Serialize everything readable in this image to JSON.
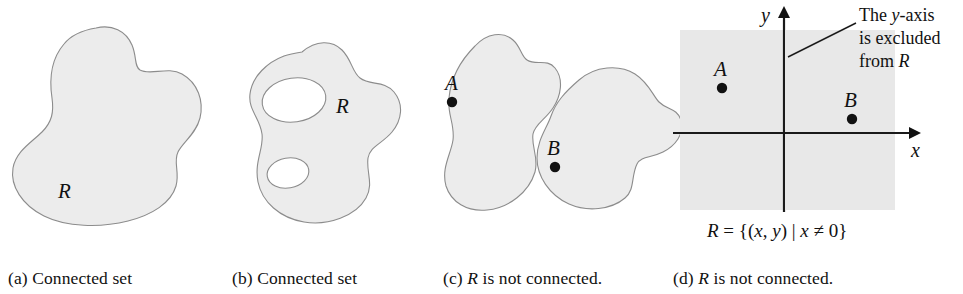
{
  "figure": {
    "panels": [
      {
        "id": "a",
        "caption_tag": "(a)",
        "caption_text": "Connected set",
        "region_label": "R",
        "points": []
      },
      {
        "id": "b",
        "caption_tag": "(b)",
        "caption_text": "Connected set",
        "region_label": "R",
        "points": []
      },
      {
        "id": "c",
        "caption_tag": "(c)",
        "caption_prefix_italic": "R",
        "caption_text": "is not connected.",
        "points": [
          {
            "label": "A"
          },
          {
            "label": "B"
          }
        ]
      },
      {
        "id": "d",
        "caption_tag": "(d)",
        "caption_prefix_italic": "R",
        "caption_text": "is not connected.",
        "axis_x_label": "x",
        "axis_y_label": "y",
        "points": [
          {
            "label": "A"
          },
          {
            "label": "B"
          }
        ],
        "annotation_lines": [
          {
            "pre": "The ",
            "italic": "y",
            "post": "-axis"
          },
          {
            "pre": "is excluded",
            "italic": "",
            "post": ""
          },
          {
            "pre": "from ",
            "italic": "R",
            "post": ""
          }
        ],
        "set_builder": {
          "lhs": "R",
          "equals": " = ",
          "open": "{(",
          "var_x": "x",
          "comma": ", ",
          "var_y": "y",
          "bar": ") | ",
          "cond_var": "x",
          "cond_rel": " ≠ 0",
          "close": "}"
        }
      }
    ]
  },
  "colors": {
    "region_fill": "#ececec",
    "region_stroke": "#8c8c8c",
    "plane_fill": "#e8e8e8",
    "axis": "#1a1a1a",
    "text": "#111111",
    "background": "#ffffff"
  }
}
